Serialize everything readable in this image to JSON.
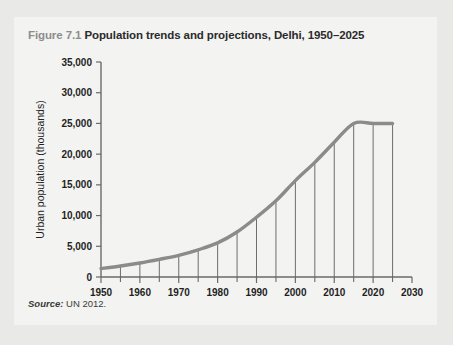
{
  "figure": {
    "number_label": "Figure 7.1",
    "title": "Population trends and projections, Delhi, 1950–2025",
    "source_label": "Source:",
    "source_text": " UN 2012."
  },
  "colors": {
    "page_background": "#e9e9e7",
    "panel_background": "#f3f3f1",
    "curve": "#8b8b8b",
    "axis": "#6a6a6a",
    "drop_line": "#5f5f5f",
    "title_number": "#8d8d8d",
    "title_text": "#2b2b2b"
  },
  "chart_data": {
    "type": "line",
    "title": "Population trends and projections, Delhi, 1950–2025",
    "xlabel": "",
    "ylabel": "Urban population (thousands)",
    "xlim": [
      1950,
      2030
    ],
    "ylim": [
      0,
      35000
    ],
    "grid": false,
    "legend": "none",
    "x_ticks": [
      1950,
      1960,
      1970,
      1980,
      1990,
      2000,
      2010,
      2020,
      2030
    ],
    "x_tick_labels": [
      "1950",
      "1960",
      "1970",
      "1980",
      "1990",
      "2000",
      "2010",
      "2020",
      "2030"
    ],
    "x_minor_ticks": [
      1955,
      1965,
      1975,
      1985,
      1995,
      2005,
      2015,
      2025
    ],
    "y_ticks": [
      0,
      5000,
      10000,
      15000,
      20000,
      25000,
      30000,
      35000
    ],
    "y_tick_labels": [
      "0",
      "5,000",
      "10,000",
      "15,000",
      "20,000",
      "25,000",
      "30,000",
      "35,000"
    ],
    "drop_line_years": [
      1955,
      1960,
      1965,
      1970,
      1975,
      1980,
      1985,
      1990,
      1995,
      2000,
      2005,
      2010,
      2015,
      2020,
      2025
    ],
    "x": [
      1950,
      1955,
      1960,
      1965,
      1970,
      1975,
      1980,
      1985,
      1990,
      1995,
      2000,
      2005,
      2010,
      2015,
      2020,
      2025
    ],
    "values": [
      1369,
      1782,
      2283,
      2879,
      3531,
      4426,
      5558,
      7327,
      9726,
      12407,
      15692,
      18666,
      21935,
      25000,
      25000,
      25000
    ],
    "series": [
      {
        "name": "Urban population of Delhi",
        "values": [
          1369,
          1782,
          2283,
          2879,
          3531,
          4426,
          5558,
          7327,
          9726,
          12407,
          15692,
          18666,
          21935,
          25000,
          25000,
          25000
        ]
      }
    ],
    "annotations": []
  }
}
